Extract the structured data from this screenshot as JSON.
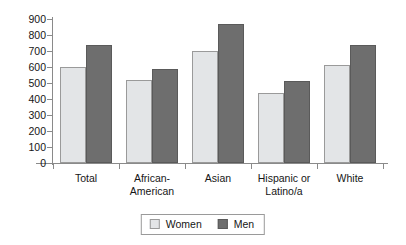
{
  "chart_data": {
    "type": "bar",
    "title": "",
    "xlabel": "",
    "ylabel": "",
    "ylim": [
      0,
      900
    ],
    "ytick_step": 100,
    "yticks": [
      0,
      100,
      200,
      300,
      400,
      500,
      600,
      700,
      800,
      900
    ],
    "grid": false,
    "legend_position": "bottom-center",
    "categories": [
      "Total",
      "African-American",
      "Asian",
      "Hispanic or Latino/a",
      "White"
    ],
    "category_lines": [
      [
        "Total"
      ],
      [
        "African-",
        "American"
      ],
      [
        "Asian"
      ],
      [
        "Hispanic or",
        "Latino/a"
      ],
      [
        "White"
      ]
    ],
    "series": [
      {
        "name": "Women",
        "color": "#e3e5e7",
        "border_color": "#9a9a9a",
        "values": [
          600,
          520,
          700,
          435,
          610
        ]
      },
      {
        "name": "Men",
        "color": "#6e6e6e",
        "border_color": "#5a5a5a",
        "values": [
          740,
          590,
          870,
          510,
          740
        ]
      }
    ]
  },
  "legend": {
    "items": [
      {
        "label": "Women"
      },
      {
        "label": "Men"
      }
    ]
  },
  "colors": {
    "women": "#e3e5e7",
    "men": "#6e6e6e",
    "axis": "#8a8a8a",
    "text": "#161616",
    "background": "#ffffff"
  }
}
